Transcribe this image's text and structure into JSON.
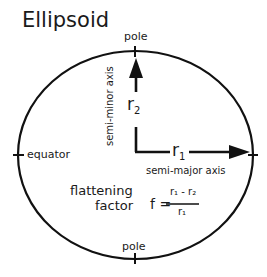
{
  "title": "Ellipsoid",
  "labels": {
    "pole_top": "pole",
    "pole_bottom": "pole",
    "equator": "equator",
    "semi_major_axis": "semi-major axis",
    "semi_minor_axis": "semi-minor axis",
    "r1": "r",
    "r1_sub": "1",
    "r2": "r",
    "r2_sub": "2",
    "flattening_line1": "flattening",
    "flattening_line2": "factor",
    "formula_lhs": "f =",
    "formula_numerator": "r₁ - r₂",
    "formula_denominator": "r₁"
  },
  "colors": {
    "stroke": "#111111",
    "background": "#ffffff"
  }
}
